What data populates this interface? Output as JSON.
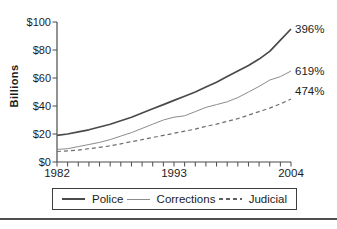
{
  "figure": {
    "background": "#ffffff",
    "axis_color": "#4a4a4a",
    "text_color": "#1c1c1c"
  },
  "chart_data": {
    "type": "line",
    "title": "",
    "xlabel": "",
    "ylabel": "Billions",
    "ylim": [
      0,
      100
    ],
    "x_range": [
      1982,
      2004
    ],
    "grid": false,
    "legend_position": "bottom",
    "x_minor_tick_every_year": true,
    "y_ticks": [
      {
        "value": 100,
        "label": "$100"
      },
      {
        "value": 80,
        "label": "$80"
      },
      {
        "value": 60,
        "label": "$60"
      },
      {
        "value": 40,
        "label": "$40"
      },
      {
        "value": 20,
        "label": "$20"
      },
      {
        "value": 0,
        "label": "$0"
      }
    ],
    "x_tick_labels": [
      {
        "value": 1982,
        "label": "1982"
      },
      {
        "value": 1993,
        "label": "1993"
      },
      {
        "value": 2004,
        "label": "2004"
      }
    ],
    "series": [
      {
        "name": "Police",
        "line": "solid",
        "width": 1.7,
        "color": "#4a4a4a",
        "end_label": "396%",
        "values": [
          19,
          20,
          21.5,
          23,
          25,
          27,
          29.5,
          32,
          35,
          38,
          41,
          44,
          47,
          50,
          53.5,
          57,
          61,
          65,
          69,
          73.5,
          79,
          87,
          95
        ]
      },
      {
        "name": "Corrections",
        "line": "solid",
        "width": 1,
        "color": "#8c8c8c",
        "end_label": "619%",
        "values": [
          9,
          9.5,
          11,
          12.5,
          14,
          16,
          18.5,
          21,
          24,
          27,
          30,
          32,
          33,
          36,
          39,
          41,
          43,
          46,
          50,
          54,
          58.5,
          61,
          65
        ]
      },
      {
        "name": "Judicial",
        "line": "dashed",
        "width": 1.2,
        "color": "#6e6e6e",
        "end_label": "474%",
        "values": [
          7.5,
          8,
          8.5,
          9.5,
          10.5,
          11.5,
          13,
          14.5,
          16,
          17.5,
          19,
          20.5,
          22,
          23.5,
          25.5,
          27,
          29,
          31,
          33.5,
          36,
          38.5,
          41.5,
          45
        ]
      }
    ]
  },
  "legend": {
    "items": [
      {
        "label": "Police",
        "swatch": "solid-thick"
      },
      {
        "label": "Corrections",
        "swatch": "solid-thin"
      },
      {
        "label": "Judicial",
        "swatch": "dashed"
      }
    ]
  }
}
